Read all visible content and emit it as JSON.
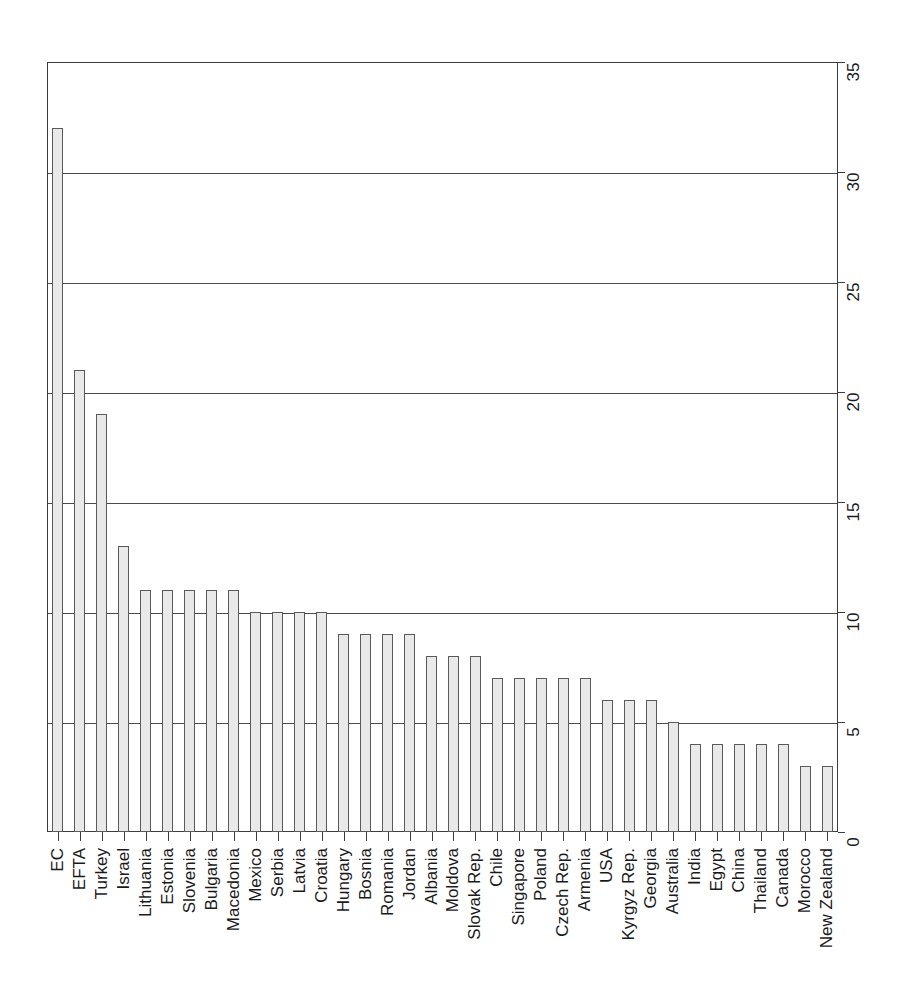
{
  "chart_data": {
    "type": "bar",
    "title": "",
    "subtitle": "",
    "xlabel": "",
    "ylabel": "",
    "ylim": [
      0,
      35
    ],
    "yticks": [
      0,
      5,
      10,
      15,
      20,
      25,
      30,
      35
    ],
    "grid": true,
    "legend": null,
    "orientation": "vertical",
    "bar_color": "#e9e9e9",
    "bar_edge_color": "#5a5a5a",
    "axis_color": "#3d3d3d",
    "categories": [
      "EC",
      "EFTA",
      "Turkey",
      "Israel",
      "Lithuania",
      "Estonia",
      "Slovenia",
      "Bulgaria",
      "Macedonia",
      "Mexico",
      "Serbia",
      "Latvia",
      "Croatia",
      "Hungary",
      "Bosnia",
      "Romania",
      "Jordan",
      "Albania",
      "Moldova",
      "Slovak Rep.",
      "Chile",
      "Singapore",
      "Poland",
      "Czech Rep.",
      "Armenia",
      "USA",
      "Kyrgyz Rep.",
      "Georgia",
      "Australia",
      "India",
      "Egypt",
      "China",
      "Thailand",
      "Canada",
      "Morocco",
      "New Zealand"
    ],
    "values": [
      32,
      21,
      19,
      13,
      11,
      11,
      11,
      11,
      11,
      10,
      10,
      10,
      10,
      9,
      9,
      9,
      9,
      8,
      8,
      8,
      7,
      7,
      7,
      7,
      7,
      6,
      6,
      6,
      5,
      4,
      4,
      4,
      4,
      4,
      3,
      3
    ]
  }
}
